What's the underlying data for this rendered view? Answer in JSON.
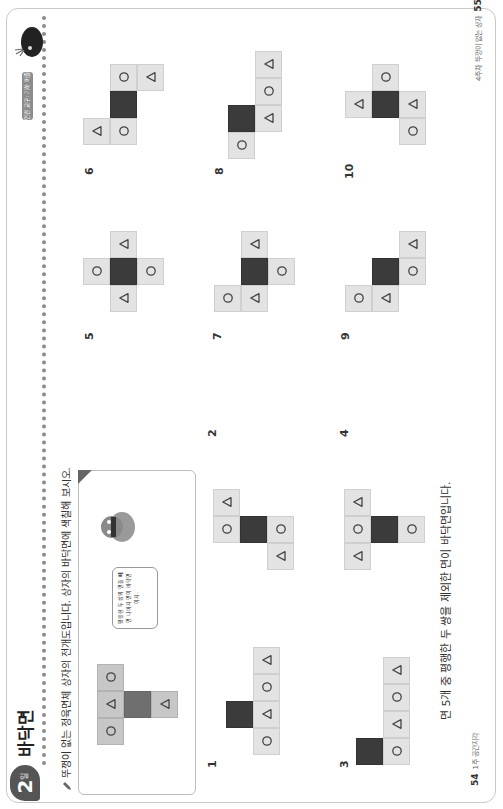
{
  "left_page": {
    "day_badge": {
      "number": "2",
      "suffix": "일"
    },
    "title": "바닥면",
    "instruction": "뚜껑이 없는 정육면체 상자의 전개도입니다. 상자의 바닥면에 색칠해 보시오.",
    "example": {
      "speech_bubble": "평행한 두 쌍의 면을 빼면 나머지 면이 바닥면이지.",
      "net": [
        {
          "c": 0,
          "r": 0,
          "s": "circle"
        },
        {
          "c": 1,
          "r": 0,
          "s": "triangle"
        },
        {
          "c": 2,
          "r": 0,
          "s": "circle"
        },
        {
          "c": 1,
          "r": 1,
          "s": "dark"
        },
        {
          "c": 1,
          "r": 2,
          "s": "triangle"
        }
      ]
    },
    "problems": [
      {
        "label": "1",
        "net": [
          {
            "c": 0,
            "r": 1,
            "s": "circle"
          },
          {
            "c": 1,
            "r": 1,
            "s": "triangle"
          },
          {
            "c": 2,
            "r": 1,
            "s": "circle"
          },
          {
            "c": 3,
            "r": 1,
            "s": "triangle"
          },
          {
            "c": 1,
            "r": 0,
            "s": "dark"
          }
        ]
      },
      {
        "label": "2",
        "net": [
          {
            "c": 2,
            "r": 0,
            "s": "triangle"
          },
          {
            "c": 1,
            "r": 0,
            "s": "circle"
          },
          {
            "c": 1,
            "r": 1,
            "s": "dark"
          },
          {
            "c": 1,
            "r": 2,
            "s": "circle"
          },
          {
            "c": 0,
            "r": 2,
            "s": "triangle"
          }
        ]
      },
      {
        "label": "3",
        "net": [
          {
            "c": 0,
            "r": 1,
            "s": "circle"
          },
          {
            "c": 1,
            "r": 1,
            "s": "triangle"
          },
          {
            "c": 2,
            "r": 1,
            "s": "circle"
          },
          {
            "c": 3,
            "r": 1,
            "s": "triangle"
          },
          {
            "c": 0,
            "r": 0,
            "s": "dark"
          }
        ]
      },
      {
        "label": "4",
        "net": [
          {
            "c": 0,
            "r": 0,
            "s": "triangle"
          },
          {
            "c": 1,
            "r": 0,
            "s": "circle"
          },
          {
            "c": 2,
            "r": 0,
            "s": "triangle"
          },
          {
            "c": 1,
            "r": 1,
            "s": "dark"
          },
          {
            "c": 1,
            "r": 2,
            "s": "circle"
          }
        ]
      }
    ],
    "hint": "면 5개 중 평행한 두 쌍을 제외한 면이 바닥면입니다.",
    "footer": {
      "page": "54",
      "section": "1주 공간지각"
    }
  },
  "right_page": {
    "lesson_badge": "연관 교구: 기하 퍼즐",
    "problems": [
      {
        "label": "5",
        "net": [
          {
            "c": 2,
            "r": 1,
            "s": "triangle"
          },
          {
            "c": 1,
            "r": 0,
            "s": "circle"
          },
          {
            "c": 1,
            "r": 1,
            "s": "dark"
          },
          {
            "c": 1,
            "r": 2,
            "s": "circle"
          },
          {
            "c": 0,
            "r": 1,
            "s": "triangle"
          }
        ]
      },
      {
        "label": "6",
        "net": [
          {
            "c": 2,
            "r": 1,
            "s": "circle"
          },
          {
            "c": 2,
            "r": 2,
            "s": "triangle"
          },
          {
            "c": 1,
            "r": 1,
            "s": "dark"
          },
          {
            "c": 0,
            "r": 0,
            "s": "triangle"
          },
          {
            "c": 0,
            "r": 1,
            "s": "circle"
          }
        ]
      },
      {
        "label": "7",
        "net": [
          {
            "c": 2,
            "r": 1,
            "s": "triangle"
          },
          {
            "c": 1,
            "r": 1,
            "s": "dark"
          },
          {
            "c": 1,
            "r": 2,
            "s": "circle"
          },
          {
            "c": 0,
            "r": 0,
            "s": "circle"
          },
          {
            "c": 0,
            "r": 1,
            "s": "triangle"
          }
        ]
      },
      {
        "label": "8",
        "net": [
          {
            "c": 3,
            "r": 1,
            "s": "triangle"
          },
          {
            "c": 2,
            "r": 1,
            "s": "circle"
          },
          {
            "c": 1,
            "r": 1,
            "s": "triangle"
          },
          {
            "c": 1,
            "r": 0,
            "s": "dark"
          },
          {
            "c": 0,
            "r": 0,
            "s": "circle"
          }
        ]
      },
      {
        "label": "9",
        "net": [
          {
            "c": 2,
            "r": 2,
            "s": "triangle"
          },
          {
            "c": 1,
            "r": 1,
            "s": "dark"
          },
          {
            "c": 1,
            "r": 2,
            "s": "circle"
          },
          {
            "c": 0,
            "r": 0,
            "s": "circle"
          },
          {
            "c": 0,
            "r": 1,
            "s": "triangle"
          }
        ]
      },
      {
        "label": "10",
        "net": [
          {
            "c": 2,
            "r": 1,
            "s": "circle"
          },
          {
            "c": 1,
            "r": 0,
            "s": "triangle"
          },
          {
            "c": 1,
            "r": 1,
            "s": "dark"
          },
          {
            "c": 1,
            "r": 2,
            "s": "triangle"
          },
          {
            "c": 0,
            "r": 2,
            "s": "circle"
          }
        ]
      }
    ],
    "footer": {
      "page": "55",
      "section": "4주차 뚜껑이 없는 상자"
    }
  },
  "colors": {
    "cell": "#e3e3e3",
    "dark_cell": "#3b3b3b",
    "example_cell": "#c7c7c7",
    "example_dark": "#6f6f6f",
    "badge": "#555555"
  }
}
